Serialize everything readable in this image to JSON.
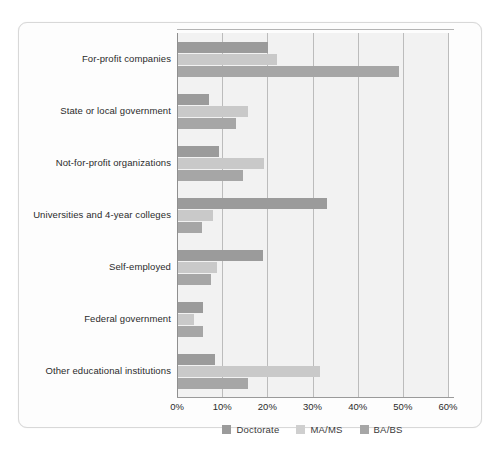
{
  "chart_data": {
    "type": "bar",
    "orientation": "horizontal",
    "title": "",
    "subtitle": "",
    "xlabel": "",
    "ylabel": "",
    "xlim": [
      0,
      60
    ],
    "xunit": "%",
    "grid": true,
    "legend_position": "bottom",
    "xticks": [
      "0%",
      "10%",
      "20%",
      "30%",
      "40%",
      "50%",
      "60%"
    ],
    "xtick_values": [
      0,
      10,
      20,
      30,
      40,
      50,
      60
    ],
    "categories": [
      "For-profit companies",
      "State or local government",
      "Not-for-profit organizations",
      "Universities and 4-year colleges",
      "Self-employed",
      "Federal government",
      "Other educational institutions"
    ],
    "series": [
      {
        "name": "Doctorate",
        "color": "#9b9b9b",
        "values": [
          20.0,
          6.9,
          9.0,
          33.0,
          18.8,
          5.5,
          8.2
        ]
      },
      {
        "name": "MA/MS",
        "color": "#c9c9c9",
        "values": [
          22.0,
          15.5,
          19.0,
          7.7,
          8.6,
          3.5,
          31.5
        ]
      },
      {
        "name": "BA/BS",
        "color": "#a6a6a6",
        "values": [
          49.0,
          12.8,
          14.5,
          5.3,
          7.3,
          5.5,
          15.5
        ]
      }
    ]
  },
  "legend": {
    "items": [
      {
        "label": "Doctorate",
        "key": "doctorate"
      },
      {
        "label": "MA/MS",
        "key": "mams"
      },
      {
        "label": "BA/BS",
        "key": "babs"
      }
    ]
  },
  "colors": {
    "doctorate": "#9b9b9b",
    "mams": "#c9c9c9",
    "babs": "#a6a6a6",
    "plot_background": "#f2f2f2",
    "gridline": "#bcbcbc",
    "axis": "#9a9a9a",
    "text": "#2b2b2b",
    "card_border": "#d8d8d8"
  }
}
